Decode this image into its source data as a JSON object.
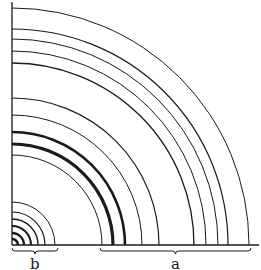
{
  "diagram": {
    "colors": {
      "line": "#1a1a1a",
      "background": "#ffffff"
    },
    "origin": {
      "x": 12,
      "y": 245
    },
    "axis": {
      "x_end": 259,
      "y_top": 2
    },
    "group_b": {
      "label": "b",
      "arcs": [
        {
          "r": 6,
          "w": 2.6
        },
        {
          "r": 12,
          "w": 2.4
        },
        {
          "r": 19,
          "w": 2.0
        },
        {
          "r": 26,
          "w": 1.4
        },
        {
          "r": 33,
          "w": 1.2
        },
        {
          "r": 43,
          "w": 1.0
        }
      ],
      "brace": {
        "x1": 12,
        "x2": 58
      }
    },
    "group_a": {
      "label": "a",
      "arcs": [
        {
          "r": 90,
          "w": 1.0
        },
        {
          "r": 101,
          "w": 3.2
        },
        {
          "r": 113,
          "w": 2.6
        },
        {
          "r": 130,
          "w": 1.0
        },
        {
          "r": 147,
          "w": 1.2
        },
        {
          "r": 182,
          "w": 1.3
        },
        {
          "r": 194,
          "w": 1.0
        },
        {
          "r": 206,
          "w": 1.0
        },
        {
          "r": 216,
          "w": 1.2
        },
        {
          "r": 237,
          "w": 1.0
        }
      ],
      "brace": {
        "x1": 100,
        "x2": 251
      }
    }
  }
}
